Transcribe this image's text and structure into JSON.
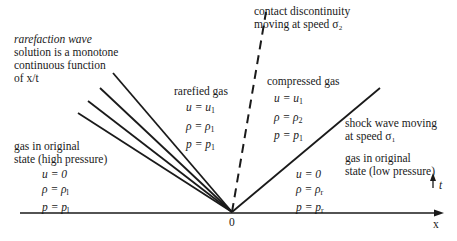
{
  "diagram": {
    "type": "riemann-problem-xt-diagram",
    "axis": {
      "x_label": "x",
      "t_label": "t",
      "origin_label": "0"
    },
    "rarefaction": {
      "title": "rarefaction wave",
      "line1": "solution is a monotone",
      "line2": "continuous function",
      "line3": "of x/t"
    },
    "contact": {
      "line1": "contact discontinuity",
      "line2": "moving at speed σ₂"
    },
    "shock": {
      "line1": "shock wave moving",
      "line2": "at speed σ₁"
    },
    "regions": {
      "left_original": {
        "line1": "gas in original",
        "line2": "state (high pressure)",
        "u": "u = 0",
        "rho": "ρ = ρ",
        "rho_sub": "l",
        "p": "p = p",
        "p_sub": "l"
      },
      "rarefied": {
        "title": "rarefied gas",
        "u": "u = u",
        "u_sub": "1",
        "rho": "ρ = ρ",
        "rho_sub": "1",
        "p": "p = p",
        "p_sub": "1"
      },
      "compressed": {
        "title": "compressed gas",
        "u": "u = u",
        "u_sub": "1",
        "rho": "ρ = ρ",
        "rho_sub": "2",
        "p": "p = p",
        "p_sub": "1"
      },
      "right_original": {
        "line1": "gas in original",
        "line2": "state (low pressure)",
        "u": "u = 0",
        "rho": "ρ = ρ",
        "rho_sub": "r",
        "p": "p = p",
        "p_sub": "r"
      }
    }
  }
}
